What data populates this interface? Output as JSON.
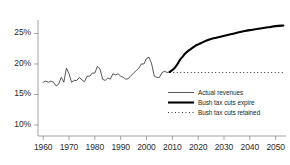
{
  "chart_data": {
    "type": "line",
    "title": "",
    "subtitle": "",
    "xlabel": "",
    "ylabel": "",
    "xlim": [
      1958,
      2054
    ],
    "ylim": [
      8.2,
      27.2
    ],
    "grid": false,
    "legend_position": "inside-lower-right",
    "ytick_labels": [
      "25%",
      "20%",
      "15%",
      "10%"
    ],
    "ytick_values": [
      25,
      20,
      15,
      10
    ],
    "xtick_labels": [
      "1960",
      "1970",
      "1980",
      "1990",
      "2000",
      "2010",
      "2020",
      "2030",
      "2040",
      "2050"
    ],
    "xtick_values": [
      1960,
      1970,
      1980,
      1990,
      2000,
      2010,
      2020,
      2030,
      2040,
      2050
    ],
    "series": [
      {
        "name": "Actual revenues",
        "style": "thin-solid",
        "color": "#231f20",
        "x": [
          1960,
          1961,
          1962,
          1963,
          1964,
          1965,
          1966,
          1967,
          1968,
          1969,
          1970,
          1971,
          1972,
          1973,
          1974,
          1975,
          1976,
          1977,
          1978,
          1979,
          1980,
          1981,
          1982,
          1983,
          1984,
          1985,
          1986,
          1987,
          1988,
          1989,
          1990,
          1991,
          1992,
          1993,
          1994,
          1995,
          1996,
          1997,
          1998,
          1999,
          2000,
          2001,
          2002,
          2003,
          2004,
          2005,
          2006,
          2007,
          2008,
          2009
        ],
        "values": [
          17.0,
          17.2,
          17.0,
          17.2,
          17.0,
          16.4,
          16.7,
          17.8,
          17.0,
          19.3,
          18.4,
          17.0,
          17.3,
          17.3,
          17.8,
          17.4,
          17.1,
          18.0,
          18.0,
          18.5,
          18.5,
          19.6,
          19.2,
          17.5,
          17.3,
          17.7,
          17.5,
          18.4,
          18.2,
          18.4,
          18.0,
          17.8,
          17.5,
          17.6,
          18.1,
          18.5,
          18.9,
          19.3,
          20.0,
          20.0,
          20.9,
          21.1,
          20.0,
          18.0,
          17.8,
          17.8,
          18.6,
          18.8,
          18.6,
          18.7
        ]
      },
      {
        "name": "Bush tax cuts expire",
        "style": "thick-solid",
        "color": "#000000",
        "x": [
          2009,
          2010,
          2011,
          2012,
          2013,
          2014,
          2015,
          2016,
          2017,
          2018,
          2019,
          2020,
          2021,
          2022,
          2023,
          2025,
          2027,
          2029,
          2031,
          2033,
          2035,
          2038,
          2041,
          2044,
          2047,
          2050,
          2053
        ],
        "values": [
          18.7,
          19.0,
          19.4,
          20.0,
          20.7,
          21.2,
          21.7,
          22.1,
          22.4,
          22.7,
          23.0,
          23.2,
          23.4,
          23.6,
          23.8,
          24.1,
          24.3,
          24.5,
          24.7,
          24.9,
          25.1,
          25.4,
          25.6,
          25.8,
          26.0,
          26.2,
          26.3
        ]
      },
      {
        "name": "Bush tax cuts retained",
        "style": "dotted",
        "color": "#231f20",
        "x": [
          2009,
          2053
        ],
        "values": [
          18.6,
          18.6
        ]
      }
    ],
    "legend": [
      {
        "label": "Actual revenues",
        "style": "thin-solid"
      },
      {
        "label": "Bush tax cuts expire",
        "style": "thick-solid"
      },
      {
        "label": "Bush tax cuts retained",
        "style": "dotted"
      }
    ],
    "colors": {
      "axis": "#8d8d8d",
      "text": "#231f20",
      "actual": "#231f20",
      "expire": "#000000",
      "retained": "#231f20",
      "background": "#ffffff"
    }
  }
}
